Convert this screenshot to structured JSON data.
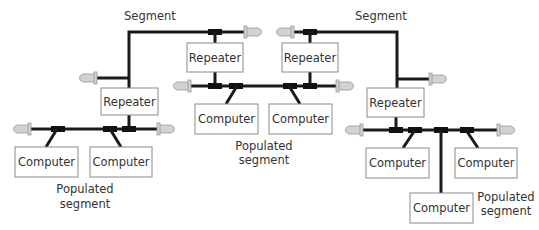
{
  "labels": {
    "segment_left": "Segment",
    "segment_right": "Segment",
    "populated_left_1": "Populated",
    "populated_left_2": "segment",
    "populated_center_1": "Populated",
    "populated_center_2": "segment",
    "populated_right_1": "Populated",
    "populated_right_2": "segment"
  },
  "nodes": {
    "repeater_left": "Repeater",
    "repeater_center_left": "Repeater",
    "repeater_center_right": "Repeater",
    "repeater_right": "Repeater",
    "computer_left_1": "Computer",
    "computer_left_2": "Computer",
    "computer_center_1": "Computer",
    "computer_center_2": "Computer",
    "computer_right_1": "Computer",
    "computer_right_2": "Computer",
    "computer_right_3": "Computer"
  },
  "colors": {
    "wire": "#1a1a1a",
    "terminator": "#d2d2d2",
    "t_connector": "#111111",
    "box_border": "#8a8a8a",
    "text": "#333333"
  }
}
